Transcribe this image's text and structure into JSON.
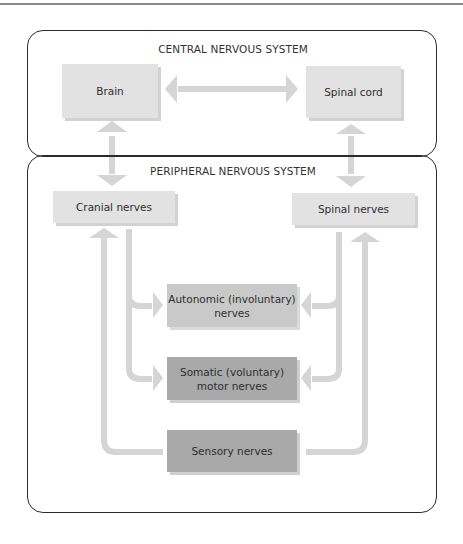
{
  "diagram": {
    "sections": {
      "central": {
        "title": "CENTRAL NERVOUS SYSTEM"
      },
      "peripheral": {
        "title": "PERIPHERAL NERVOUS SYSTEM"
      }
    },
    "nodes": {
      "brain": "Brain",
      "spinal_cord": "Spinal cord",
      "cranial_nerves": "Cranial nerves",
      "spinal_nerves": "Spinal nerves",
      "autonomic_line1": "Autonomic (involuntary)",
      "autonomic_line2": "nerves",
      "somatic_line1": "Somatic (voluntary)",
      "somatic_line2": "motor nerves",
      "sensory": "Sensory nerves"
    },
    "edges": [
      {
        "from": "Brain",
        "to": "Spinal cord",
        "type": "bidirectional"
      },
      {
        "from": "Brain",
        "to": "Cranial nerves",
        "type": "bidirectional"
      },
      {
        "from": "Spinal cord",
        "to": "Spinal nerves",
        "type": "bidirectional"
      },
      {
        "from": "Cranial nerves",
        "to": "Autonomic (involuntary) nerves"
      },
      {
        "from": "Cranial nerves",
        "to": "Somatic (voluntary) motor nerves"
      },
      {
        "from": "Spinal nerves",
        "to": "Autonomic (involuntary) nerves"
      },
      {
        "from": "Spinal nerves",
        "to": "Somatic (voluntary) motor nerves"
      },
      {
        "from": "Sensory nerves",
        "to": "Cranial nerves"
      },
      {
        "from": "Sensory nerves",
        "to": "Spinal nerves"
      }
    ],
    "colors": {
      "arrow": "#d4d4d4",
      "box_light": "#e2e2e2",
      "box_mid": "#c9c9c9",
      "box_dark": "#a9a9a9",
      "border": "#2b2b2b"
    }
  }
}
